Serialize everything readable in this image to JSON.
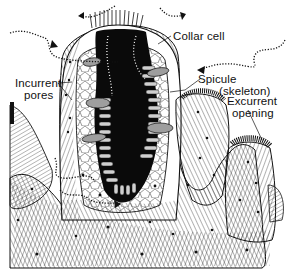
{
  "figure": {
    "labels": {
      "collar_cell": "Collar cell",
      "spicule_line1": "Spicule",
      "spicule_line2": "(skeleton)",
      "incurrent_line1": "Incurrent",
      "incurrent_line2": "pores",
      "excurrent_line1": "Excurrent",
      "excurrent_line2": "opening"
    },
    "colors": {
      "ink": "#111111",
      "background": "#ffffff",
      "cavity": "#0a0a0a",
      "cell_fill": "#bdbdbd"
    }
  }
}
